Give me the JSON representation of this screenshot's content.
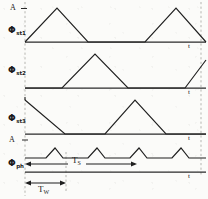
{
  "figure": {
    "kind": "timing-diagram",
    "width": 208,
    "height": 199,
    "ink_color": "#1f1f1f",
    "paper_color": "#fbfbf9",
    "guide_color": "#8a8a82"
  },
  "labels": {
    "amplitude_top": "A",
    "amplitude_ripple": "A",
    "axis_time": "t",
    "phase_1": "Φ",
    "phase_1_sub": "st1",
    "phase_2": "Φ",
    "phase_2_sub": "st2",
    "phase_3": "Φ",
    "phase_3_sub": "st3",
    "phase_4": "Φ",
    "phase_4_sub": "ph",
    "period_long": "T",
    "period_long_sub": "S",
    "period_short": "T",
    "period_short_sub": "W"
  },
  "traces": [
    {
      "name": "phi-st1",
      "label": "Φst1",
      "baseline_y": 42,
      "peak_y": 8,
      "points": "25,42 57,8 88,42 145,42 176,8 206,42"
    },
    {
      "name": "phi-st2",
      "label": "Φst2",
      "baseline_y": 88,
      "peak_y": 54,
      "points": "25,88 62,88 95,54 128,88 185,88 206,60"
    },
    {
      "name": "phi-st3",
      "label": "Φst3",
      "baseline_y": 134,
      "peak_y": 100,
      "points": "25,100 25,100 65,134 105,134 135,100 166,134 206,134"
    },
    {
      "name": "phi-ph",
      "label": "ήph",
      "baseline_y": 158,
      "peak_y": 148,
      "points": "25,158 46,158 55,148 63,158 88,158 97,148 105,158 130,158 139,148 147,158 172,158 181,148 189,158 206,158"
    }
  ],
  "axes": [
    {
      "name": "axis-1",
      "y": 42,
      "x1": 25,
      "x2": 206,
      "tick_label": "t",
      "tick_x": 188,
      "tick_y": 44
    },
    {
      "name": "axis-2",
      "y": 88,
      "x1": 25,
      "x2": 206,
      "tick_label": "t",
      "tick_x": 188,
      "tick_y": 90
    },
    {
      "name": "axis-3",
      "y": 134,
      "x1": 25,
      "x2": 206,
      "tick_label": "t",
      "tick_x": 188,
      "tick_y": 136
    },
    {
      "name": "axis-4",
      "y": 172,
      "x1": 25,
      "x2": 206,
      "tick_label": "t",
      "tick_x": 188,
      "tick_y": 174
    }
  ],
  "guides": [
    {
      "name": "guide-left",
      "x": 25,
      "y1": 2,
      "y2": 196
    },
    {
      "name": "guide-right",
      "x": 201,
      "y1": 2,
      "y2": 176
    },
    {
      "name": "guide-tw-right",
      "x": 66,
      "y1": 160,
      "y2": 196
    }
  ],
  "dimensions": [
    {
      "name": "period-long",
      "label": "T",
      "sub": "S",
      "y": 164,
      "x1": 25,
      "x2": 137,
      "label_x": 77,
      "label_y": 158
    },
    {
      "name": "period-short",
      "label": "T",
      "sub": "W",
      "y": 183,
      "x1": 25,
      "x2": 66,
      "label_x": 40,
      "label_y": 188
    }
  ],
  "amplitude_markers": [
    {
      "name": "amp-marker-top",
      "label": "A",
      "x": 14,
      "y": 8,
      "tick_x": 25,
      "tick_y": 8
    },
    {
      "name": "amp-marker-ripple",
      "label": "A",
      "x": 14,
      "y": 140,
      "tick_x": 25,
      "tick_y": 140
    }
  ]
}
